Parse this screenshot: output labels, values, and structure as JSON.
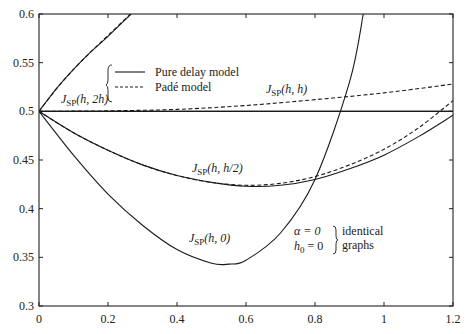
{
  "chart_data": {
    "type": "line",
    "title": "",
    "xlabel": "",
    "ylabel": "",
    "xlim": [
      0,
      1.2
    ],
    "ylim": [
      0.3,
      0.6
    ],
    "grid": false,
    "x_ticks": [
      "0",
      "0.2",
      "0.4",
      "0.6",
      "0.8",
      "1",
      "1.2"
    ],
    "y_ticks": [
      "0.3",
      "0.35",
      "0.4",
      "0.45",
      "0.5",
      "0.55",
      "0.6"
    ],
    "legend": {
      "position": "upper-left-inside",
      "entries": [
        {
          "label": "Pure delay model",
          "style": "solid"
        },
        {
          "label": "Padé model",
          "style": "dashed"
        }
      ]
    },
    "series": [
      {
        "name": "Horizontal reference 0.5",
        "style": "solid",
        "x": [
          0,
          1.2
        ],
        "y": [
          0.5,
          0.5
        ]
      },
      {
        "name": "J_SP(h, 2h) pure delay",
        "style": "solid",
        "x": [
          0,
          0.05,
          0.1,
          0.15,
          0.2,
          0.267
        ],
        "y": [
          0.5,
          0.523,
          0.543,
          0.561,
          0.577,
          0.6
        ]
      },
      {
        "name": "J_SP(h, 2h) Padé",
        "style": "dashed",
        "x": [
          0,
          0.05,
          0.1,
          0.15,
          0.2,
          0.265
        ],
        "y": [
          0.5,
          0.523,
          0.543,
          0.561,
          0.578,
          0.6
        ]
      },
      {
        "name": "J_SP(h, h) pure delay",
        "style": "solid",
        "x": [
          0,
          0.4,
          0.8,
          1.2
        ],
        "y": [
          0.5,
          0.5,
          0.5,
          0.5
        ]
      },
      {
        "name": "J_SP(h, h) Padé",
        "style": "dashed",
        "x": [
          0,
          0.2,
          0.4,
          0.6,
          0.8,
          1.0,
          1.2
        ],
        "y": [
          0.5,
          0.5005,
          0.502,
          0.506,
          0.512,
          0.519,
          0.528
        ]
      },
      {
        "name": "J_SP(h, h/2) pure delay",
        "style": "solid",
        "x": [
          0,
          0.1,
          0.2,
          0.3,
          0.4,
          0.5,
          0.6,
          0.7,
          0.8,
          0.9,
          1.0,
          1.1,
          1.2
        ],
        "y": [
          0.5,
          0.478,
          0.46,
          0.445,
          0.434,
          0.427,
          0.423,
          0.424,
          0.43,
          0.441,
          0.455,
          0.474,
          0.496
        ]
      },
      {
        "name": "J_SP(h, h/2) Padé",
        "style": "dashed",
        "x": [
          0,
          0.1,
          0.2,
          0.3,
          0.4,
          0.5,
          0.6,
          0.7,
          0.8,
          0.9,
          1.0,
          1.1,
          1.2
        ],
        "y": [
          0.5,
          0.478,
          0.46,
          0.445,
          0.434,
          0.427,
          0.424,
          0.426,
          0.433,
          0.445,
          0.461,
          0.483,
          0.511
        ]
      },
      {
        "name": "J_SP(h, 0) (alpha=0, h0=0 identical graphs)",
        "style": "solid",
        "x": [
          0,
          0.1,
          0.2,
          0.3,
          0.4,
          0.5,
          0.55,
          0.6,
          0.7,
          0.8,
          0.9,
          0.94
        ],
        "y": [
          0.5,
          0.455,
          0.415,
          0.383,
          0.358,
          0.344,
          0.343,
          0.347,
          0.375,
          0.43,
          0.53,
          0.6
        ]
      }
    ],
    "annotations": [
      {
        "text": "J_SP(h, 2h)",
        "x": 0.02,
        "y": 0.512
      },
      {
        "text": "J_SP(h, h)",
        "x": 0.8,
        "y": 0.52
      },
      {
        "text": "J_SP(h, h/2)",
        "x": 0.38,
        "y": 0.433
      },
      {
        "text": "J_SP(h, 0)",
        "x": 0.37,
        "y": 0.367
      },
      {
        "text": "α = 0 / h0 = 0 } identical graphs",
        "x": 0.66,
        "y": 0.36
      }
    ]
  },
  "labels": {
    "legend_solid": "Pure delay model",
    "legend_dashed": "Padé model",
    "curve_2h_main": "J",
    "curve_2h_sub": "SP",
    "curve_2h_arg": "(h, 2h)",
    "curve_h_main": "J",
    "curve_h_sub": "SP",
    "curve_h_arg": "(h, h)",
    "curve_h2_main": "J",
    "curve_h2_sub": "SP",
    "curve_h2_arg": "(h, h/2)",
    "curve_0_main": "J",
    "curve_0_sub": "SP",
    "curve_0_arg": "(h, 0)",
    "alpha_eq": "α = 0",
    "h0_main": "h",
    "h0_sub": "0",
    "h0_eq": " = 0",
    "identical_1": "identical",
    "identical_2": "graphs"
  },
  "colors": {
    "line": "#1a1a1a",
    "axis": "#222222",
    "background": "#ffffff"
  }
}
